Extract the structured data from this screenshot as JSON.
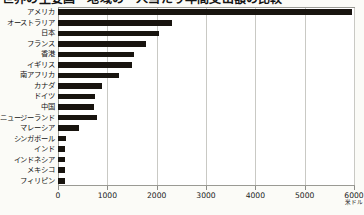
{
  "title": {
    "text": "世界の主要国・地域の一人当たり年間支出額の比較",
    "cutoff": true
  },
  "axis": {
    "unit": "米ドル",
    "ticks": [
      {
        "value": 0,
        "label": "0"
      },
      {
        "value": 1000,
        "label": "1000"
      },
      {
        "value": 2000,
        "label": "2000"
      },
      {
        "value": 3000,
        "label": "3000"
      },
      {
        "value": 4000,
        "label": "4000"
      },
      {
        "value": 5000,
        "label": "5000"
      },
      {
        "value": 6000,
        "label": "6000"
      }
    ],
    "min": 0,
    "max": 6000
  },
  "colors": {
    "bar": "#18140f",
    "grid": "#c9c9c4",
    "frame": "#9a9a94",
    "plot_background": "#ffffff",
    "page_background": "#fbfbf7"
  },
  "chart_data": {
    "type": "bar",
    "orientation": "horizontal",
    "title": "世界の主要国・地域の一人当たり年間支出額の比較",
    "xlabel": "米ドル",
    "ylabel": "",
    "xlim": [
      0,
      6000
    ],
    "grid": true,
    "legend": false,
    "categories": [
      "アメリカ",
      "オーストラリア",
      "日本",
      "フランス",
      "香港",
      "イギリス",
      "南アフリカ",
      "カナダ",
      "ドイツ",
      "中国",
      "ニュージーランド",
      "マレーシア",
      "シンガポール",
      "インド",
      "インドネシア",
      "メキシコ",
      "フィリピン"
    ],
    "values": [
      5950,
      2310,
      2040,
      1790,
      1550,
      1500,
      1240,
      900,
      760,
      720,
      790,
      420,
      160,
      140,
      150,
      140,
      150
    ]
  }
}
